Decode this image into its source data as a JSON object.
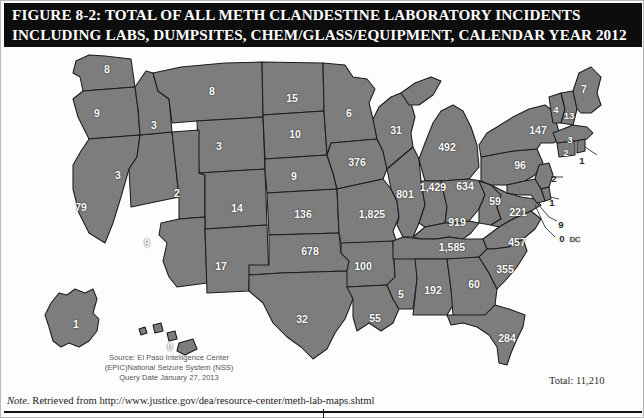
{
  "title": {
    "line1": "FIGURE 8-2: TOTAL OF ALL METH CLANDESTINE LABORATORY INCIDENTS",
    "line2": "INCLUDING LABS, DUMPSITES, CHEM/GLASS/EQUIPMENT, CALENDAR YEAR 2012"
  },
  "source": {
    "line1": "Source: El Paso Intelligence Center",
    "line2": "(EPIC)National Seizure System (NSS)",
    "line3": "Query Date January 27, 2013"
  },
  "total_label": "Total: 11,210",
  "footer": {
    "note_prefix": "Note.",
    "note_text": " Retrieved from http://www.justice.gov/dea/resource-center/meth-lab-maps.shtml"
  },
  "dc_marker": "DC",
  "chart_data": {
    "type": "map",
    "title": "FIGURE 8-2: TOTAL OF ALL METH CLANDESTINE LABORATORY INCIDENTS INCLUDING LABS, DUMPSITES, CHEM/GLASS/EQUIPMENT, CALENDAR YEAR 2012",
    "unit": "incidents",
    "total": "11,210",
    "legend": "none",
    "regions": [
      {
        "id": "WA",
        "value": "8",
        "x": 106,
        "y": 22
      },
      {
        "id": "OR",
        "value": "9",
        "x": 96,
        "y": 66
      },
      {
        "id": "CA",
        "value": "79",
        "x": 80,
        "y": 160
      },
      {
        "id": "NV",
        "value": "3",
        "x": 117,
        "y": 128
      },
      {
        "id": "ID",
        "value": "3",
        "x": 153,
        "y": 78
      },
      {
        "id": "MT",
        "value": "8",
        "x": 211,
        "y": 44
      },
      {
        "id": "WY",
        "value": "3",
        "x": 218,
        "y": 99
      },
      {
        "id": "UT",
        "value": "2",
        "x": 176,
        "y": 146
      },
      {
        "id": "AZ",
        "value": "9",
        "x": 146,
        "y": 196
      },
      {
        "id": "NM",
        "value": "17",
        "x": 220,
        "y": 219
      },
      {
        "id": "CO",
        "value": "14",
        "x": 236,
        "y": 161
      },
      {
        "id": "ND",
        "value": "15",
        "x": 291,
        "y": 51
      },
      {
        "id": "SD",
        "value": "10",
        "x": 294,
        "y": 87
      },
      {
        "id": "NE",
        "value": "9",
        "x": 293,
        "y": 129
      },
      {
        "id": "KS",
        "value": "136",
        "x": 302,
        "y": 167
      },
      {
        "id": "OK",
        "value": "678",
        "x": 309,
        "y": 204
      },
      {
        "id": "TX",
        "value": "32",
        "x": 301,
        "y": 272
      },
      {
        "id": "MN",
        "value": "6",
        "x": 348,
        "y": 66
      },
      {
        "id": "IA",
        "value": "376",
        "x": 356,
        "y": 115
      },
      {
        "id": "MO",
        "value": "1,825",
        "x": 371,
        "y": 167
      },
      {
        "id": "AR",
        "value": "100",
        "x": 362,
        "y": 219
      },
      {
        "id": "LA",
        "value": "55",
        "x": 374,
        "y": 271
      },
      {
        "id": "WI",
        "value": "31",
        "x": 395,
        "y": 83
      },
      {
        "id": "IL",
        "value": "801",
        "x": 404,
        "y": 147
      },
      {
        "id": "MS",
        "value": "5",
        "x": 400,
        "y": 247
      },
      {
        "id": "MI",
        "value": "492",
        "x": 446,
        "y": 100
      },
      {
        "id": "IN",
        "value": "1,429",
        "x": 432,
        "y": 140
      },
      {
        "id": "KY",
        "value": "919",
        "x": 456,
        "y": 175
      },
      {
        "id": "TN",
        "value": "1,585",
        "x": 451,
        "y": 200
      },
      {
        "id": "AL",
        "value": "192",
        "x": 432,
        "y": 243
      },
      {
        "id": "OH",
        "value": "634",
        "x": 464,
        "y": 139
      },
      {
        "id": "GA",
        "value": "60",
        "x": 473,
        "y": 237
      },
      {
        "id": "FL",
        "value": "284",
        "x": 506,
        "y": 291
      },
      {
        "id": "WV",
        "value": "59",
        "x": 494,
        "y": 154
      },
      {
        "id": "VA",
        "value": "221",
        "x": 517,
        "y": 165
      },
      {
        "id": "NC",
        "value": "457",
        "x": 516,
        "y": 195
      },
      {
        "id": "SC",
        "value": "355",
        "x": 504,
        "y": 222
      },
      {
        "id": "PA",
        "value": "96",
        "x": 519,
        "y": 118
      },
      {
        "id": "NY",
        "value": "147",
        "x": 537,
        "y": 83
      },
      {
        "id": "VT",
        "value": "4",
        "x": 555,
        "y": 62
      },
      {
        "id": "NH",
        "value": "13",
        "x": 568,
        "y": 68
      },
      {
        "id": "ME",
        "value": "7",
        "x": 583,
        "y": 42
      },
      {
        "id": "MA",
        "value": "3",
        "x": 569,
        "y": 92
      },
      {
        "id": "CT",
        "value": "2",
        "x": 565,
        "y": 105
      },
      {
        "id": "RI",
        "value": "1",
        "x": 581,
        "y": 113
      },
      {
        "id": "NJ",
        "value": "2",
        "x": 553,
        "y": 131
      },
      {
        "id": "DE",
        "value": "1",
        "x": 551,
        "y": 155
      },
      {
        "id": "MD",
        "value": "9",
        "x": 560,
        "y": 177
      },
      {
        "id": "DC",
        "value": "0",
        "x": 561,
        "y": 191
      },
      {
        "id": "AK",
        "value": "1",
        "x": 75,
        "y": 277
      },
      {
        "id": "HI",
        "value": "0",
        "x": 169,
        "y": 300
      }
    ]
  }
}
